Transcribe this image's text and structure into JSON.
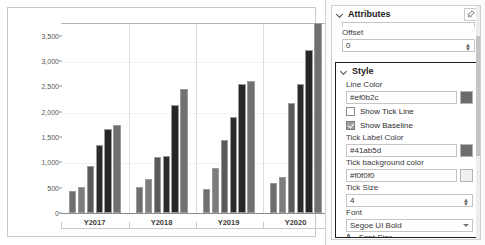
{
  "chart_data": {
    "type": "bar",
    "title": "",
    "xlabel": "",
    "ylabel": "",
    "categories": [
      "Y2017",
      "Y2018",
      "Y2019",
      "Y2020"
    ],
    "ylim": [
      0,
      3750
    ],
    "yticks": [
      0,
      500,
      1000,
      1500,
      2000,
      2500,
      3000,
      3500
    ],
    "ytick_labels": [
      "0",
      "500",
      "1,000",
      "1,500",
      "2,000",
      "2,500",
      "3,000",
      "3,500"
    ],
    "grid": false,
    "legend": "none",
    "bars_per_group": 6,
    "series_colors": [
      "#6e6e6e",
      "#7d7d7d",
      "#5a5a5a",
      "#2b2b2b",
      "#262626",
      "#707070"
    ],
    "groups": [
      {
        "category": "Y2017",
        "values": [
          440,
          520,
          930,
          1350,
          1650,
          1730
        ]
      },
      {
        "category": "Y2018",
        "values": [
          510,
          680,
          1100,
          1120,
          2140,
          2450
        ]
      },
      {
        "category": "Y2019",
        "values": [
          480,
          880,
          1440,
          1900,
          2550,
          2600
        ]
      },
      {
        "category": "Y2020",
        "values": [
          590,
          710,
          2170,
          2540,
          3220,
          3750
        ]
      }
    ]
  },
  "panel": {
    "attributes": {
      "title": "Attributes",
      "pin_icon": "pin-icon",
      "collapse_icon": "chevron-down-icon",
      "truncated_field_value": "",
      "offset": {
        "label": "Offset",
        "value": "0"
      }
    },
    "style": {
      "title": "Style",
      "collapse_icon": "chevron-down-icon",
      "line_color": {
        "label": "Line Color",
        "value": "#ef0b2c",
        "swatch_color": "#6b6b6b"
      },
      "show_tick_line": {
        "label": "Show Tick Line",
        "checked": false
      },
      "show_baseline": {
        "label": "Show Baseline",
        "checked": true
      },
      "tick_label_color": {
        "label": "Tick Label Color",
        "value": "#41ab5d",
        "swatch_color": "#6e6e6e"
      },
      "tick_background_color": {
        "label": "Tick background color",
        "value": "#f0f0f0",
        "swatch_color": "#f0f0f0"
      },
      "tick_size": {
        "label": "Tick Size",
        "value": "4"
      },
      "font": {
        "label": "Font",
        "value": "Segoe UI Bold"
      },
      "font_size": {
        "label": "Font Size",
        "icon": "font-size-icon",
        "value": "12"
      }
    }
  }
}
